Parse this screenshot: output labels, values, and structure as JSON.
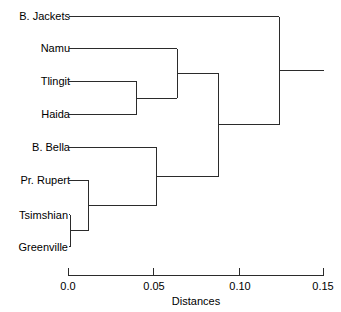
{
  "chart_data": {
    "type": "dendrogram",
    "title": "",
    "xlabel": "Distances",
    "ylabel": "",
    "xlim": [
      0.0,
      0.15
    ],
    "grid": false,
    "legend": "none",
    "orientation": "horizontal",
    "tick_labels": [
      "0.0",
      "0.05",
      "0.10",
      "0.15"
    ],
    "tick_values": [
      0.0,
      0.05,
      0.1,
      0.15
    ],
    "leaves": [
      {
        "label": "B. Jackets",
        "order": 0
      },
      {
        "label": "Namu",
        "order": 1
      },
      {
        "label": "Tlingit",
        "order": 2
      },
      {
        "label": "Haida",
        "order": 3
      },
      {
        "label": "B. Bella",
        "order": 4
      },
      {
        "label": "Pr. Rupert",
        "order": 5
      },
      {
        "label": "Tsimshian",
        "order": 6
      },
      {
        "label": "Greenville",
        "order": 7
      }
    ],
    "merges": [
      {
        "id": "m1",
        "children": [
          "Tsimshian",
          "Greenville"
        ],
        "distance": 0.001
      },
      {
        "id": "m2",
        "children": [
          "Pr. Rupert",
          "m1"
        ],
        "distance": 0.012
      },
      {
        "id": "m3",
        "children": [
          "Tlingit",
          "Haida"
        ],
        "distance": 0.04
      },
      {
        "id": "m4",
        "children": [
          "B. Bella",
          "m2"
        ],
        "distance": 0.052
      },
      {
        "id": "m5",
        "children": [
          "Namu",
          "m3"
        ],
        "distance": 0.064
      },
      {
        "id": "m6",
        "children": [
          "m5",
          "m4"
        ],
        "distance": 0.088
      },
      {
        "id": "m7",
        "children": [
          "B. Jackets",
          "m6"
        ],
        "distance": 0.124
      }
    ],
    "root_stub_end": 0.15,
    "line_color": "#2b2b2b"
  },
  "axis": {
    "title": "Distances",
    "ticks": [
      "0.0",
      "0.05",
      "0.10",
      "0.15"
    ]
  },
  "labels": {
    "b_jackets": "B. Jackets",
    "namu": "Namu",
    "tlingit": "Tlingit",
    "haida": "Haida",
    "b_bella": "B. Bella",
    "pr_rupert": "Pr. Rupert",
    "tsimshian": "Tsimshian",
    "greenville": "Greenville"
  }
}
